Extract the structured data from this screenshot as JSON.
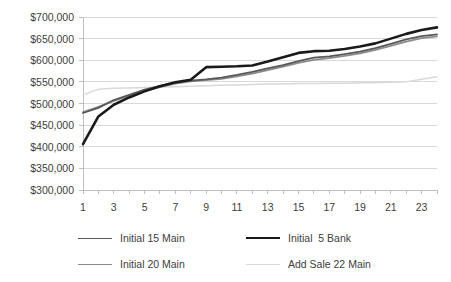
{
  "chart_data": {
    "type": "line",
    "title": "",
    "xlabel": "",
    "ylabel": "",
    "x": [
      1,
      2,
      3,
      4,
      5,
      6,
      7,
      8,
      9,
      10,
      11,
      12,
      13,
      14,
      15,
      16,
      17,
      18,
      19,
      20,
      21,
      22,
      23,
      24
    ],
    "xtick_labels": [
      "1",
      "3",
      "5",
      "7",
      "9",
      "11",
      "13",
      "15",
      "17",
      "19",
      "21",
      "23"
    ],
    "xtick_values": [
      1,
      3,
      5,
      7,
      9,
      11,
      13,
      15,
      17,
      19,
      21,
      23
    ],
    "ytick_labels": [
      "$700,000",
      "$650,000",
      "$600,000",
      "$550,000",
      "$500,000",
      "$450,000",
      "$400,000",
      "$350,000",
      "$300,000"
    ],
    "ytick_values": [
      700000,
      650000,
      600000,
      550000,
      500000,
      450000,
      400000,
      350000,
      300000
    ],
    "ylim": [
      300000,
      700000
    ],
    "xlim": [
      1,
      24
    ],
    "grid": "horizontal",
    "legend_position": "bottom",
    "series": [
      {
        "name": "Initial 15 Main",
        "color": "#595959",
        "width": 1.8,
        "values": [
          478000,
          490000,
          508000,
          520000,
          532000,
          541000,
          548000,
          553000,
          556000,
          560000,
          566000,
          573000,
          581000,
          589000,
          598000,
          606000,
          609000,
          614000,
          620000,
          628000,
          638000,
          648000,
          656000,
          660000
        ]
      },
      {
        "name": "Initial  5 Bank",
        "color": "#1a1a1a",
        "width": 2.6,
        "values": [
          406000,
          470000,
          497000,
          514000,
          528000,
          540000,
          549000,
          555000,
          584000,
          585000,
          586000,
          588000,
          597000,
          607000,
          617000,
          621000,
          622000,
          626000,
          632000,
          639000,
          650000,
          661000,
          670000,
          676000
        ]
      },
      {
        "name": "Initial 20 Main",
        "color": "#8c8c8c",
        "width": 1.8,
        "values": [
          480000,
          492000,
          506000,
          518000,
          529000,
          538000,
          546000,
          551000,
          554000,
          557000,
          563000,
          569000,
          577000,
          585000,
          594000,
          601000,
          605000,
          610000,
          616000,
          624000,
          633000,
          643000,
          651000,
          655000
        ]
      },
      {
        "name": "Add Sale 22 Main",
        "color": "#d9d9d9",
        "width": 1.5,
        "values": [
          520000,
          533000,
          535000,
          536000,
          537000,
          538000,
          539000,
          540000,
          541000,
          542000,
          543000,
          544000,
          545000,
          545000,
          546000,
          546000,
          547000,
          547000,
          548000,
          548000,
          549000,
          550000,
          556000,
          562000
        ]
      }
    ]
  }
}
